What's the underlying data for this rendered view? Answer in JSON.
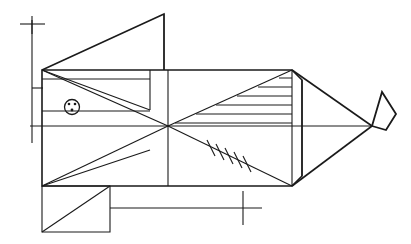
{
  "artwork": {
    "title": "Geometric Fish Line Drawing",
    "style": "abstract constructivist line art",
    "medium": "black ink line drawing on white ground",
    "canvas": {
      "width": 411,
      "height": 244,
      "background_color": "#ffffff"
    },
    "line_color": "#1a1a1a"
  },
  "elements": {
    "body": {
      "name": "fish-body-polygon",
      "description": "large irregular hexagonal body block forming the trunk of the fish",
      "points": "42,70 292,70 302,80 302,176 292,186 42,186"
    },
    "body_midline": {
      "name": "body-horizontal-midline",
      "description": "horizontal line running the full width through the centre of the body",
      "points": "30,126 372,126"
    },
    "converge_point": {
      "x": 168,
      "y": 126
    },
    "internal_diagonals": [
      {
        "name": "diagonal-top-left-to-centre",
        "points": "42,70 168,126"
      },
      {
        "name": "diagonal-bottom-left-to-centre",
        "points": "42,186 168,126"
      },
      {
        "name": "diagonal-centre-to-top-right",
        "points": "168,126 292,70"
      },
      {
        "name": "diagonal-centre-to-bottom-right",
        "points": "168,126 292,186"
      },
      {
        "name": "diagonal-left-corner-upper-sweep",
        "points": "42,70 150,110"
      },
      {
        "name": "diagonal-left-corner-lower-sweep",
        "points": "42,186 150,150"
      }
    ],
    "vertical_dividers": [
      {
        "name": "body-vertical-divider-left",
        "points": "150,70 150,110"
      },
      {
        "name": "body-vertical-divider-centre",
        "points": "168,70 168,186"
      },
      {
        "name": "body-vertical-divider-right",
        "points": "292,70 292,186"
      },
      {
        "name": "tail-vertical-divider",
        "points": "302,80 302,176"
      }
    ],
    "horizontal_shelves": [
      {
        "name": "shelf-upper-left",
        "points": "42,79 150,79"
      },
      {
        "name": "shelf-upper-left-lower",
        "points": "42,110 150,110"
      }
    ],
    "dorsal_fin": {
      "name": "dorsal-fin-triangle",
      "description": "large upper fin: triangle rising from the body top-left corner to apex at upper right",
      "points": "42,70 164,14 164,70",
      "apex": {
        "x": 164,
        "y": 14
      }
    },
    "ventral_fin": {
      "name": "ventral-fin-rectangle",
      "description": "rectangle below the body with a diagonal from its bottom-left to top-right",
      "rect": "42,186 110,186 110,232 42,232",
      "diagonal": "42,232 110,186"
    },
    "tail": {
      "name": "tail-triangle",
      "description": "converging triangle at the right terminating in a point",
      "points": "292,70 372,126 292,186",
      "tip": {
        "x": 372,
        "y": 126
      }
    },
    "tail_diamond": {
      "name": "tail-tip-diamond",
      "description": "small rhombus flag beyond the tail point",
      "points": "372,126 382,92 396,114 386,130"
    },
    "hatching_upper_right": {
      "name": "hatch-lines-upper-right-triangle",
      "description": "parallel horizontal rule lines filling the wedge between the centre diagonal and the body top edge",
      "line_count": 6,
      "lines": [
        {
          "points": "279,78 292,78"
        },
        {
          "points": "258,87 292,87"
        },
        {
          "points": "237,96 292,96"
        },
        {
          "points": "216,105 292,105"
        },
        {
          "points": "196,114 292,114"
        },
        {
          "points": "175,123 292,123"
        }
      ]
    },
    "hatching_lower_diagonal": {
      "name": "tick-marks-on-lower-diagonal",
      "description": "short ticks crossing the lower-right diagonal like a suture or fin ray",
      "tick_count": 5,
      "ticks": [
        {
          "points": "207,140 215,156"
        },
        {
          "points": "216,144 224,160"
        },
        {
          "points": "225,148 233,164"
        },
        {
          "points": "234,152 242,168"
        },
        {
          "points": "243,156 251,172"
        }
      ]
    },
    "eye": {
      "name": "fish-eye",
      "description": "small ringed circle with three dots inside",
      "center": {
        "x": 72,
        "y": 107
      },
      "radius": 7.5,
      "dots": [
        {
          "x": 69,
          "y": 104,
          "r": 1.3
        },
        {
          "x": 75,
          "y": 104,
          "r": 1.3
        },
        {
          "x": 72,
          "y": 110,
          "r": 1.4
        }
      ]
    },
    "reference_marks": {
      "vertical_rule": {
        "name": "left-vertical-reference-rule",
        "points": "32,20 32,143"
      },
      "top_cross": {
        "name": "top-left-cross-mark",
        "horizontal": "20,24 45,24",
        "vertical": "32,16 32,34"
      },
      "left_tick": {
        "name": "left-side-tick",
        "points": "32,88 42,88"
      },
      "bottom_rule": {
        "name": "bottom-horizontal-reference-rule",
        "points": "110,208 262,208"
      },
      "bottom_cross": {
        "name": "bottom-right-cross-mark",
        "horizontal": "222,208 262,208",
        "vertical": "243,192 243,224"
      }
    }
  },
  "labels": {
    "figure_caption": ""
  }
}
